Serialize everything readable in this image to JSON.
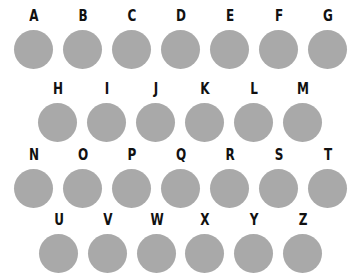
{
  "circle_color": "#a9a9a9",
  "rows": [
    {
      "y": 8,
      "items": [
        {
          "letter": "A",
          "x": 14
        },
        {
          "letter": "B",
          "x": 63
        },
        {
          "letter": "C",
          "x": 112
        },
        {
          "letter": "D",
          "x": 161
        },
        {
          "letter": "E",
          "x": 210
        },
        {
          "letter": "F",
          "x": 259
        },
        {
          "letter": "G",
          "x": 308
        }
      ]
    },
    {
      "y": 81,
      "items": [
        {
          "letter": "H",
          "x": 38
        },
        {
          "letter": "I",
          "x": 87
        },
        {
          "letter": "J",
          "x": 136
        },
        {
          "letter": "K",
          "x": 185
        },
        {
          "letter": "L",
          "x": 234
        },
        {
          "letter": "M",
          "x": 283
        }
      ]
    },
    {
      "y": 147,
      "items": [
        {
          "letter": "N",
          "x": 14
        },
        {
          "letter": "O",
          "x": 63
        },
        {
          "letter": "P",
          "x": 112
        },
        {
          "letter": "Q",
          "x": 161
        },
        {
          "letter": "R",
          "x": 210
        },
        {
          "letter": "S",
          "x": 259
        },
        {
          "letter": "T",
          "x": 308
        }
      ]
    },
    {
      "y": 212,
      "items": [
        {
          "letter": "U",
          "x": 39
        },
        {
          "letter": "V",
          "x": 88
        },
        {
          "letter": "W",
          "x": 137
        },
        {
          "letter": "X",
          "x": 185
        },
        {
          "letter": "Y",
          "x": 234
        },
        {
          "letter": "Z",
          "x": 283
        }
      ]
    }
  ]
}
